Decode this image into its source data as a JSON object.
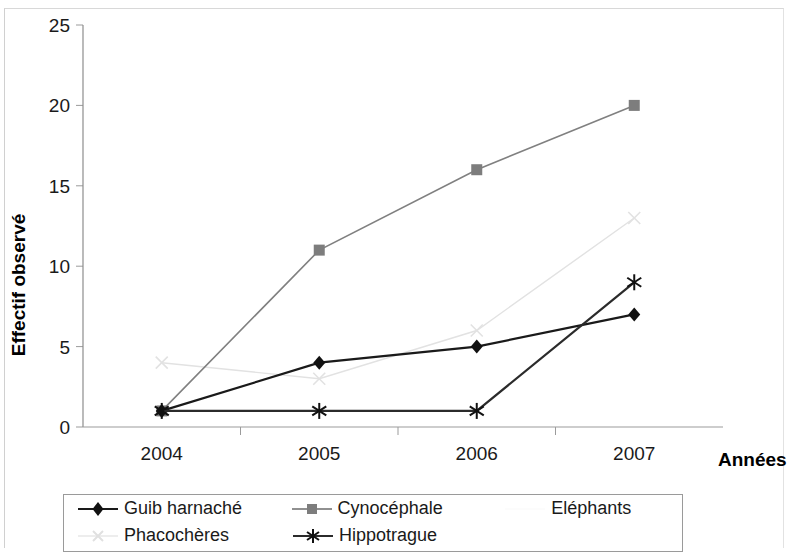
{
  "chart_data": {
    "type": "line",
    "title": "",
    "xlabel": "Années",
    "ylabel": "Effectif observé",
    "categories": [
      "2004",
      "2005",
      "2006",
      "2007"
    ],
    "x": [
      2004,
      2005,
      2006,
      2007
    ],
    "ylim": [
      0,
      25
    ],
    "xlim": [
      2003.5,
      2007.5
    ],
    "yticks": [
      "0",
      "5",
      "10",
      "15",
      "20",
      "25"
    ],
    "ytick_values": [
      0,
      5,
      10,
      15,
      20,
      25
    ],
    "grid": false,
    "legend_position": "bottom",
    "series": [
      {
        "name": "Guib harnaché",
        "values": [
          1,
          4,
          5,
          7
        ],
        "color": "#1a1a1a",
        "marker": "diamond"
      },
      {
        "name": "Cynocéphale",
        "values": [
          1,
          11,
          16,
          20
        ],
        "color": "#808080",
        "marker": "square"
      },
      {
        "name": "Eléphants",
        "values": [
          null,
          null,
          null,
          null
        ],
        "color": "#fbfbfb",
        "marker": "none"
      },
      {
        "name": "Phacochères",
        "values": [
          4,
          3,
          6,
          13
        ],
        "color": "#e2e2e2",
        "marker": "cross"
      },
      {
        "name": "Hippotrague",
        "values": [
          1,
          1,
          1,
          9
        ],
        "color": "#2b2b2b",
        "marker": "asterisk"
      }
    ]
  },
  "legend": {
    "rows": [
      [
        {
          "label": "Guib harnaché",
          "marker": "diamond",
          "color": "#1a1a1a"
        },
        {
          "label": "Cynocéphale",
          "marker": "square",
          "color": "#808080"
        },
        {
          "label": "Eléphants",
          "marker": "none",
          "color": "#fcfcfc"
        }
      ],
      [
        {
          "label": "Phacochères",
          "marker": "cross",
          "color": "#e4e4e4"
        },
        {
          "label": "Hippotrague",
          "marker": "asterisk",
          "color": "#2b2b2b"
        }
      ]
    ]
  },
  "axes": {
    "y_title": "Effectif observé",
    "x_title": "Années"
  }
}
